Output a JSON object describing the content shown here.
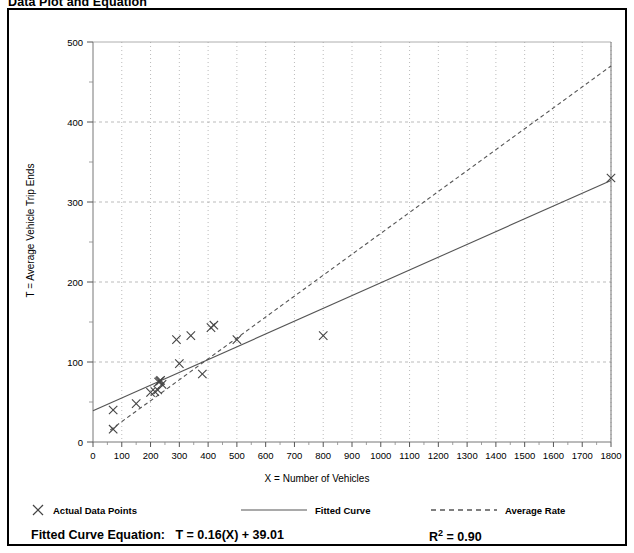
{
  "figure": {
    "title": "Data Plot and Equation"
  },
  "axes": {
    "x_title": "X = Number of Vehicles",
    "y_title": "T = Average Vehicle Trip Ends",
    "x_ticks": [
      "0",
      "100",
      "200",
      "300",
      "400",
      "500",
      "600",
      "700",
      "800",
      "900",
      "1000",
      "1100",
      "1200",
      "1300",
      "1400",
      "1500",
      "1600",
      "1700",
      "1800"
    ],
    "y_ticks": [
      "0",
      "100",
      "200",
      "300",
      "400",
      "500"
    ]
  },
  "legend": {
    "items": [
      {
        "label": "Actual Data Points",
        "marker": "x-marker-icon"
      },
      {
        "label": "Fitted Curve",
        "marker": "solid-line-icon"
      },
      {
        "label": "Average Rate",
        "marker": "dashed-line-icon"
      }
    ]
  },
  "equation": {
    "label": "Fitted Curve Equation:",
    "formula": "T = 0.16(X) + 39.01",
    "r2_label": "R",
    "r2_exponent": "2",
    "r2_value": "= 0.90"
  },
  "colors": {
    "border": "#000000",
    "plot_line": "#555555",
    "grid": "#aaaaaa",
    "marker": "#444444",
    "background": "#ffffff"
  },
  "chart_data": {
    "type": "scatter",
    "title": "Data Plot and Equation",
    "xlabel": "X = Number of Vehicles",
    "ylabel": "T = Average Vehicle Trip Ends",
    "xlim": [
      0,
      1800
    ],
    "ylim": [
      0,
      500
    ],
    "xticks": [
      0,
      100,
      200,
      300,
      400,
      500,
      600,
      700,
      800,
      900,
      1000,
      1100,
      1200,
      1300,
      1400,
      1500,
      1600,
      1700,
      1800
    ],
    "yticks": [
      0,
      100,
      200,
      300,
      400,
      500
    ],
    "grid": true,
    "legend_position": "below-plot",
    "series": [
      {
        "name": "Actual Data Points",
        "type": "scatter",
        "marker": "x",
        "points": [
          [
            70,
            16
          ],
          [
            70,
            40
          ],
          [
            150,
            48
          ],
          [
            200,
            62
          ],
          [
            215,
            63
          ],
          [
            225,
            65
          ],
          [
            228,
            75
          ],
          [
            232,
            76
          ],
          [
            235,
            77
          ],
          [
            240,
            72
          ],
          [
            290,
            128
          ],
          [
            300,
            98
          ],
          [
            340,
            133
          ],
          [
            380,
            85
          ],
          [
            410,
            143
          ],
          [
            420,
            146
          ],
          [
            500,
            128
          ],
          [
            800,
            133
          ],
          [
            1800,
            330
          ]
        ]
      },
      {
        "name": "Fitted Curve",
        "type": "line",
        "style": "solid",
        "equation": "T = 0.16(X) + 39.01",
        "slope": 0.16,
        "intercept": 39.01,
        "r_squared": 0.9,
        "endpoints": [
          [
            0,
            39.01
          ],
          [
            1800,
            327.01
          ]
        ]
      },
      {
        "name": "Average Rate",
        "type": "line",
        "style": "dashed",
        "slope": 0.261,
        "intercept": 0,
        "endpoints": [
          [
            60,
            15
          ],
          [
            1800,
            470
          ]
        ]
      }
    ]
  }
}
